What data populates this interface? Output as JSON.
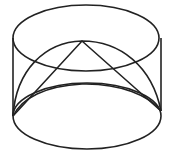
{
  "figure": {
    "stroke_color": "#222222",
    "background": "#ffffff",
    "cylinder": {
      "top_ellipse": {
        "cx": 85,
        "cy": 38,
        "rx": 73,
        "ry": 33
      },
      "bottom_ellipse": {
        "cx": 87,
        "cy": 116,
        "rx": 74,
        "ry": 33
      },
      "left_x": 13,
      "right_x": 161,
      "side_top_y": 38,
      "side_bottom_y": 116
    },
    "semicircle_arc": {
      "start": [
        13,
        116
      ],
      "control_top_y": 41,
      "end": [
        161,
        116
      ]
    },
    "triangle": {
      "apex": [
        82,
        41
      ],
      "left": [
        13,
        116
      ],
      "right": [
        161,
        116
      ]
    }
  }
}
